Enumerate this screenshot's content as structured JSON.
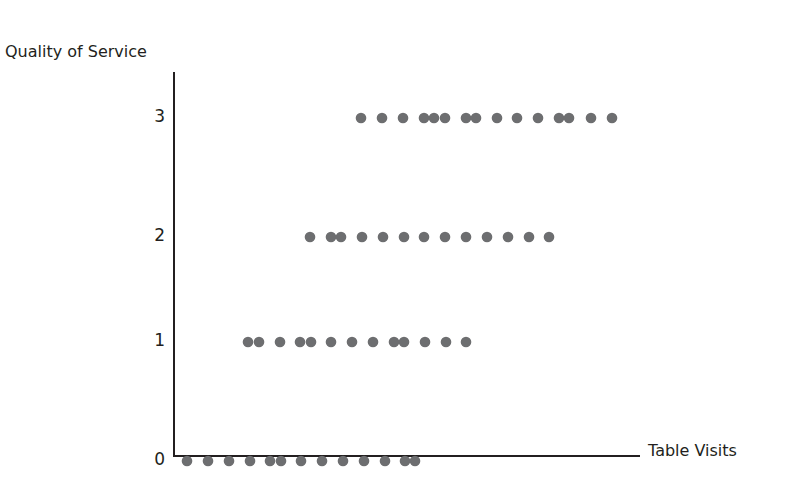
{
  "chart_data": {
    "type": "scatter",
    "title": "",
    "xlabel": "Table Visits",
    "ylabel": "Quality of Service",
    "y_ticks": [
      "0",
      "1",
      "2",
      "3"
    ],
    "x_ticks": [],
    "grid": false,
    "legend": null,
    "note": "x axis has no tick labels; x values are relative positions in half-dot-spacing units (≈10.5px)",
    "color": "#6d6e70",
    "series": [
      {
        "name": "Quality 0",
        "y": 0,
        "x": [
          1,
          3,
          5,
          7,
          9,
          10,
          12,
          14,
          16,
          18,
          20,
          22,
          23
        ],
        "px": [
          187,
          208,
          229,
          250,
          270,
          281,
          301,
          322,
          343,
          364,
          385,
          405,
          415
        ]
      },
      {
        "name": "Quality 1",
        "y": 1,
        "x": [
          7,
          8,
          10,
          12,
          13,
          15,
          17,
          19,
          21,
          22,
          24,
          26,
          28
        ],
        "px": [
          248,
          259,
          280,
          300,
          311,
          331,
          352,
          373,
          394,
          404,
          425,
          446,
          466
        ]
      },
      {
        "name": "Quality 2",
        "y": 2,
        "x": [
          13,
          15,
          16,
          18,
          20,
          22,
          24,
          26,
          28,
          30,
          32,
          34,
          36
        ],
        "px": [
          310,
          331,
          341,
          362,
          383,
          404,
          424,
          445,
          466,
          487,
          508,
          529,
          549
        ]
      },
      {
        "name": "Quality 3",
        "y": 3,
        "x": [
          18,
          20,
          22,
          24,
          25,
          26,
          28,
          29,
          31,
          33,
          35,
          37,
          38,
          40,
          42
        ],
        "px": [
          361,
          382,
          403,
          424,
          434,
          445,
          466,
          476,
          497,
          517,
          538,
          559,
          569,
          591,
          612
        ]
      }
    ]
  },
  "labels": {
    "y_axis": "Quality of Service",
    "x_axis": "Table Visits",
    "tick_0": "0",
    "tick_1": "1",
    "tick_2": "2",
    "tick_3": "3"
  }
}
